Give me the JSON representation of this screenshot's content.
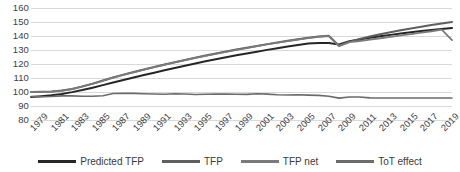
{
  "chart_data": {
    "type": "line",
    "title": "",
    "xlabel": "",
    "ylabel": "",
    "ylim": [
      80,
      160
    ],
    "ytick_step": 10,
    "yticks": [
      160,
      150,
      140,
      130,
      120,
      110,
      100,
      90,
      80
    ],
    "grid": true,
    "legend_position": "bottom",
    "x": [
      1979,
      1980,
      1981,
      1982,
      1983,
      1984,
      1985,
      1986,
      1987,
      1988,
      1989,
      1990,
      1991,
      1992,
      1993,
      1994,
      1995,
      1996,
      1997,
      1998,
      1999,
      2000,
      2001,
      2002,
      2003,
      2004,
      2005,
      2006,
      2007,
      2008,
      2009,
      2010,
      2011,
      2012,
      2013,
      2014,
      2015,
      2016,
      2017,
      2018,
      2019,
      2020
    ],
    "xtick_labels": [
      "1979",
      "1981",
      "1983",
      "1985",
      "1987",
      "1989",
      "1991",
      "1993",
      "1995",
      "1997",
      "1999",
      "2001",
      "2003",
      "2005",
      "2007",
      "2009",
      "2011",
      "2013",
      "2015",
      "2017",
      "2019"
    ],
    "series": [
      {
        "name": "Predicted TFP",
        "color": "#262626",
        "width": 2.0,
        "values": [
          96.5,
          97.0,
          97.6,
          98.6,
          99.9,
          101.4,
          103.1,
          104.9,
          106.8,
          108.6,
          110.4,
          112.1,
          113.8,
          115.5,
          117.2,
          118.8,
          120.4,
          121.9,
          123.4,
          124.8,
          126.2,
          127.5,
          128.8,
          130.1,
          131.3,
          132.5,
          133.6,
          134.6,
          135.0,
          135.0,
          134.0,
          136.2,
          137.5,
          138.7,
          139.8,
          140.8,
          141.8,
          142.7,
          143.5,
          144.3,
          145.0,
          145.7
        ]
      },
      {
        "name": "TFP",
        "color": "#5f5f5f",
        "width": 2.0,
        "values": [
          100.0,
          100.2,
          100.4,
          101.0,
          102.2,
          104.0,
          106.0,
          108.2,
          110.4,
          112.4,
          114.3,
          116.1,
          117.9,
          119.6,
          121.3,
          122.9,
          124.5,
          126.0,
          127.5,
          128.9,
          130.3,
          131.6,
          132.9,
          134.2,
          135.4,
          136.6,
          137.7,
          138.7,
          139.6,
          140.2,
          133.0,
          135.8,
          137.8,
          139.6,
          141.2,
          142.7,
          144.1,
          145.4,
          146.6,
          147.8,
          148.9,
          150.0
        ]
      },
      {
        "name": "TFP net",
        "color": "#7a7a7a",
        "width": 1.8,
        "values": [
          100.0,
          100.1,
          100.3,
          100.9,
          102.0,
          103.8,
          105.8,
          108.0,
          110.2,
          112.2,
          114.1,
          115.9,
          117.7,
          119.4,
          121.1,
          122.7,
          124.3,
          125.8,
          127.3,
          128.7,
          130.1,
          131.4,
          132.7,
          134.0,
          135.2,
          136.4,
          137.5,
          138.5,
          139.4,
          140.0,
          132.8,
          135.6,
          136.4,
          137.4,
          138.4,
          139.4,
          140.4,
          141.4,
          142.4,
          143.4,
          144.6,
          137.0
        ]
      },
      {
        "name": "ToT effect",
        "color": "#6b6b6b",
        "width": 1.6,
        "values": [
          96.8,
          96.6,
          96.8,
          97.2,
          97.2,
          97.0,
          97.0,
          97.3,
          98.9,
          99.0,
          99.0,
          98.8,
          98.6,
          98.4,
          98.8,
          98.6,
          98.2,
          98.4,
          98.5,
          98.6,
          98.4,
          98.3,
          98.7,
          98.5,
          98.0,
          97.9,
          98.0,
          97.8,
          97.6,
          97.0,
          95.6,
          96.4,
          96.4,
          95.8,
          95.7,
          95.7,
          95.7,
          95.7,
          95.7,
          95.7,
          95.7,
          95.7
        ]
      }
    ]
  },
  "legend": {
    "items": [
      {
        "label": "Predicted TFP",
        "color": "#262626"
      },
      {
        "label": "TFP",
        "color": "#5f5f5f"
      },
      {
        "label": "TFP net",
        "color": "#7a7a7a"
      },
      {
        "label": "ToT effect",
        "color": "#6b6b6b"
      }
    ]
  },
  "colors": {
    "gridline": "#d9d9d9",
    "tick_text": "#404040",
    "background": "#ffffff"
  }
}
